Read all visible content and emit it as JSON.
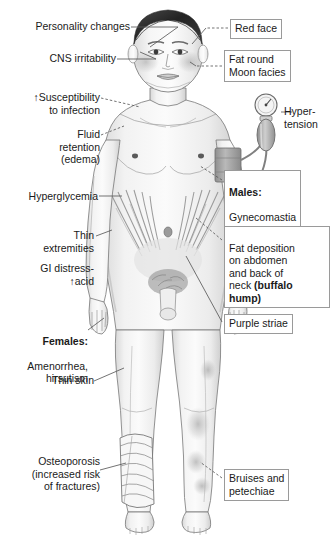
{
  "diagram": {
    "background_color": "#ffffff",
    "label_border_color": "#9a9a9a",
    "text_color": "#1a1a1a"
  },
  "labels_left": [
    {
      "id": "personality-changes",
      "text": "Personality changes",
      "boxed": false,
      "align": "right"
    },
    {
      "id": "cns-irritability",
      "text": "CNS irritability",
      "boxed": false,
      "align": "right"
    },
    {
      "id": "susceptibility-to-infection",
      "text": "↑Susceptibility\nto infection",
      "boxed": false,
      "align": "right"
    },
    {
      "id": "fluid-retention",
      "text": "Fluid\nretention\n(edema)",
      "boxed": false,
      "align": "right"
    },
    {
      "id": "hyperglycemia",
      "text": "Hyperglycemia",
      "boxed": false,
      "align": "right"
    },
    {
      "id": "thin-extremities",
      "text": "Thin\nextremities",
      "boxed": false,
      "align": "right"
    },
    {
      "id": "gi-distress",
      "text": "GI distress-\n↑acid",
      "boxed": false,
      "align": "right"
    },
    {
      "id": "females",
      "head": "Females:",
      "text": "Amenorrhea,\nhirsutism",
      "boxed": false,
      "align": "right"
    },
    {
      "id": "thin-skin",
      "text": "Thin skin",
      "boxed": false,
      "align": "right"
    },
    {
      "id": "osteoporosis",
      "text": "Osteoporosis\n(increased risk\nof fractures)",
      "boxed": false,
      "align": "right"
    }
  ],
  "labels_right": [
    {
      "id": "red-face",
      "text": "Red face",
      "boxed": true,
      "align": "left"
    },
    {
      "id": "moon-facies",
      "text": "Fat round\nMoon facies",
      "boxed": true,
      "align": "left"
    },
    {
      "id": "hypertension",
      "text": "Hyper-\ntension",
      "boxed": false,
      "align": "left"
    },
    {
      "id": "males-gynecomastia",
      "head": "Males:",
      "text": "Gynecomastia",
      "boxed": true,
      "align": "left"
    },
    {
      "id": "fat-deposition",
      "text": "Fat deposition\non abdomen\nand back of\nneck ",
      "bold_tail": "(buffalo\nhump)",
      "boxed": true,
      "align": "left"
    },
    {
      "id": "purple-striae",
      "text": "Purple striae",
      "boxed": true,
      "align": "left"
    },
    {
      "id": "bruises-petechiae",
      "text": "Bruises and\npetechiae",
      "boxed": true,
      "align": "left"
    }
  ],
  "figure_parts": {
    "head": "moon-face-head",
    "hair": "dark-hair",
    "cheeks": "flushed-cheeks",
    "bp_cuff": "blood-pressure-cuff-on-arm",
    "sphygmomanometer": "sphygmomanometer-gauge-and-bulb",
    "abdomen": "abdomen-with-purple-striae",
    "navel": "navel",
    "bandage": "leg-bandage",
    "bruising": "leg-bruising"
  }
}
